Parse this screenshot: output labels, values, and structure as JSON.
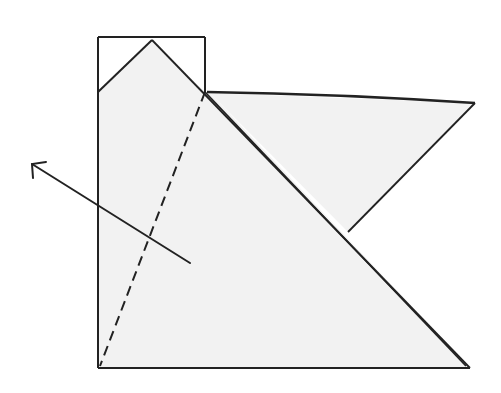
{
  "diagram": {
    "type": "origami-fold-step",
    "description": "Folded paper model with a flap; dashed valley-fold line and arrow indicating fold direction to the upper left",
    "colors": {
      "paper_fill": "#f2f2f2",
      "line": "#222222",
      "background": "#ffffff"
    },
    "elements": {
      "fold_line_style": "dashed",
      "arrow_direction": "upper-left"
    }
  }
}
